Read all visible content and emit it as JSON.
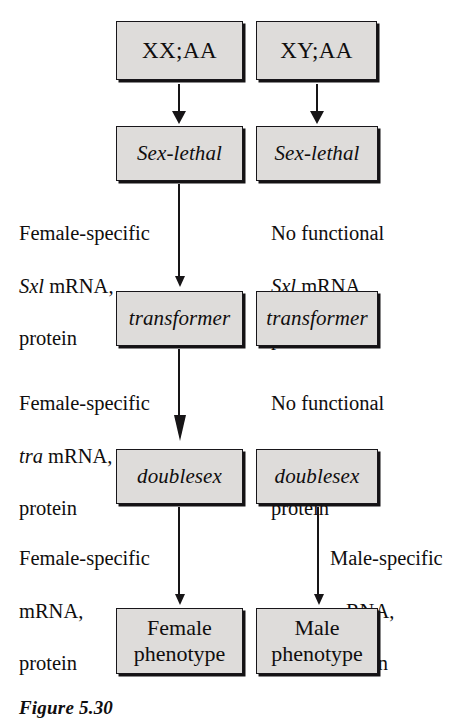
{
  "figure": {
    "caption": "Figure 5.30",
    "colors": {
      "box_fill": "#dedcda",
      "box_border": "#18161a",
      "box_shadow": "#141214",
      "text": "#100e0e",
      "background": "#ffffff"
    }
  },
  "columns": {
    "female": {
      "header": "XX;AA"
    },
    "male": {
      "header": "XY;AA"
    }
  },
  "nodes": {
    "female_karyotype": "XX;AA",
    "male_karyotype": "XY;AA",
    "female_sxl": "Sex-lethal",
    "male_sxl": "Sex-lethal",
    "female_tra": "transformer",
    "male_tra": "transformer",
    "female_dsx": "doublesex",
    "male_dsx": "doublesex",
    "female_phenotype": "Female\nphenotype",
    "male_phenotype": "Male\nphenotype"
  },
  "annotations": {
    "female_sxl_product": {
      "line1": "Female-specific",
      "gene": "Sxl",
      "line2_rest": " mRNA,",
      "line3": "protein"
    },
    "male_sxl_product": {
      "line1": "No functional",
      "gene": "Sxl",
      "line2_rest": " mRNA,",
      "line3": "protein"
    },
    "female_tra_product": {
      "line1": "Female-specific",
      "gene": "tra",
      "line2_rest": " mRNA,",
      "line3": "protein"
    },
    "male_tra_product": {
      "line1": "No functional",
      "gene": "tra",
      "line2_rest": " mRNA,",
      "line3": "protein"
    },
    "female_dsx_product": {
      "line1": "Female-specific",
      "line2": "mRNA,",
      "line3": "protein"
    },
    "male_dsx_product": {
      "line1": "Male-specific",
      "line2": "mRNA,",
      "line3": "protein"
    }
  }
}
